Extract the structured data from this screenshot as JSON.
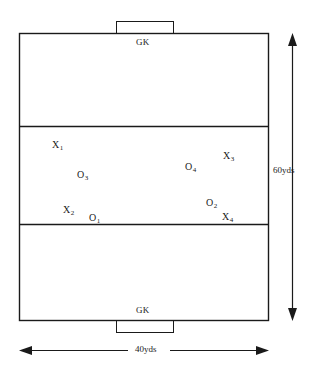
{
  "diagram": {
    "type": "soccer-field-formation",
    "field": {
      "width_label": "40yds",
      "height_label": "60yds",
      "zones": 3
    },
    "goals": [
      {
        "id": "top",
        "label": "GK"
      },
      {
        "id": "bottom",
        "label": "GK"
      }
    ],
    "players": [
      {
        "id": "x1",
        "team": "X",
        "letter": "X",
        "number": "1",
        "x": 52,
        "y": 140
      },
      {
        "id": "o3",
        "team": "O",
        "letter": "O",
        "number": "3",
        "x": 77,
        "y": 170
      },
      {
        "id": "x2",
        "team": "X",
        "letter": "X",
        "number": "2",
        "x": 63,
        "y": 205
      },
      {
        "id": "o1",
        "team": "O",
        "letter": "O",
        "number": "1",
        "x": 89,
        "y": 213
      },
      {
        "id": "o4",
        "team": "O",
        "letter": "O",
        "number": "4",
        "x": 185,
        "y": 162
      },
      {
        "id": "x3",
        "team": "X",
        "letter": "X",
        "number": "3",
        "x": 223,
        "y": 151
      },
      {
        "id": "o2",
        "team": "O",
        "letter": "O",
        "number": "2",
        "x": 206,
        "y": 198
      },
      {
        "id": "x4",
        "team": "X",
        "letter": "X",
        "number": "4",
        "x": 222,
        "y": 212
      }
    ],
    "dimensions": {
      "vertical": {
        "label": "60yds"
      },
      "horizontal": {
        "label": "40yds"
      }
    },
    "colors": {
      "line": "#1a1a1a",
      "background": "#ffffff",
      "text": "#1a1a1a"
    }
  }
}
